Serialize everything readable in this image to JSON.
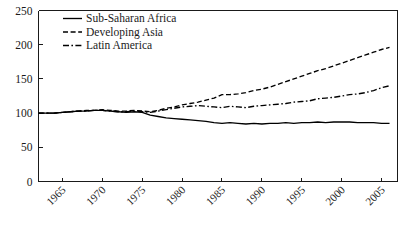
{
  "chart_data": {
    "type": "line",
    "title": "",
    "subtitle": "",
    "xlabel": "",
    "ylabel": "",
    "xlim": [
      1962,
      2007
    ],
    "ylim": [
      0,
      250
    ],
    "grid": false,
    "legend_position": "top-left",
    "yticks": [
      0,
      50,
      100,
      150,
      200,
      250
    ],
    "ytick_labels": [
      "0",
      "50",
      "100",
      "150",
      "200",
      "250"
    ],
    "xticks": [
      1965,
      1970,
      1975,
      1980,
      1985,
      1990,
      1995,
      2000,
      2005
    ],
    "xtick_labels": [
      "1965",
      "1970",
      "1975",
      "1980",
      "1985",
      "1990",
      "1995",
      "2000",
      "2005"
    ],
    "x": [
      1962,
      1963,
      1964,
      1965,
      1966,
      1967,
      1968,
      1969,
      1970,
      1971,
      1972,
      1973,
      1974,
      1975,
      1976,
      1977,
      1978,
      1979,
      1980,
      1981,
      1982,
      1983,
      1984,
      1985,
      1986,
      1987,
      1988,
      1989,
      1990,
      1991,
      1992,
      1993,
      1994,
      1995,
      1996,
      1997,
      1998,
      1999,
      2000,
      2001,
      2002,
      2003,
      2004,
      2005,
      2006
    ],
    "series": [
      {
        "name": "Sub-Saharan Africa",
        "dash": "solid",
        "values": [
          100,
          100,
          100,
          101,
          102,
          103,
          103,
          104,
          104,
          103,
          102,
          101,
          102,
          101,
          97,
          95,
          93,
          92,
          91,
          90,
          89,
          88,
          86,
          85,
          86,
          85,
          84,
          85,
          84,
          85,
          85,
          86,
          85,
          86,
          86,
          87,
          86,
          87,
          87,
          87,
          86,
          86,
          86,
          85,
          85
        ]
      },
      {
        "name": "Developing Asia",
        "dash": "dashed",
        "values": [
          100,
          100,
          100,
          101,
          102,
          103,
          104,
          104,
          105,
          104,
          103,
          103,
          104,
          103,
          102,
          104,
          107,
          109,
          112,
          114,
          116,
          119,
          122,
          127,
          127,
          128,
          130,
          133,
          135,
          138,
          142,
          146,
          150,
          154,
          158,
          162,
          165,
          169,
          173,
          177,
          181,
          185,
          189,
          193,
          196
        ]
      },
      {
        "name": "Latin America",
        "dash": "dashdot",
        "values": [
          100,
          100,
          100,
          101,
          102,
          103,
          103,
          104,
          104,
          103,
          102,
          102,
          103,
          102,
          101,
          103,
          105,
          107,
          109,
          110,
          111,
          110,
          109,
          108,
          110,
          109,
          108,
          110,
          111,
          112,
          113,
          114,
          116,
          117,
          118,
          121,
          122,
          123,
          125,
          127,
          128,
          130,
          133,
          137,
          140
        ]
      }
    ],
    "legend": [
      {
        "label": "Sub-Saharan Africa",
        "dash": "solid"
      },
      {
        "label": "Developing Asia",
        "dash": "dashed"
      },
      {
        "label": "Latin America",
        "dash": "dashdot"
      }
    ],
    "colors": {
      "series": "#000000",
      "axis": "#1a1a1a",
      "background": "#ffffff"
    }
  }
}
